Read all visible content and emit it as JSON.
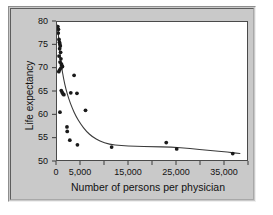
{
  "figure": {
    "background_color": "#ffffff",
    "panel_color": "#c9c9c9",
    "plot_background": "#ffffff",
    "frame_color": "#4a4a4a"
  },
  "chart_data": {
    "type": "scatter",
    "title": "",
    "xlabel": "Number of persons per physician",
    "ylabel": "Life expectancy",
    "xlim": [
      0,
      40000
    ],
    "ylim": [
      50,
      80
    ],
    "grid": false,
    "legend": null,
    "marker_color": "#1a1a1a",
    "curve_color": "#3a3a3a",
    "x_ticks": [
      0,
      5000,
      10000,
      15000,
      20000,
      25000,
      30000,
      35000,
      40000
    ],
    "x_tick_labels": [
      "0",
      "5,000",
      "",
      "15,000",
      "",
      "25,000",
      "",
      "35,000",
      ""
    ],
    "y_ticks": [
      50,
      55,
      60,
      65,
      70,
      75,
      80
    ],
    "y_tick_labels": [
      "50",
      "55",
      "60",
      "65",
      "70",
      "75",
      "80"
    ],
    "points": [
      [
        180,
        79.0
      ],
      [
        300,
        78.4
      ],
      [
        260,
        77.6
      ],
      [
        420,
        76.2
      ],
      [
        520,
        75.6
      ],
      [
        600,
        75.2
      ],
      [
        700,
        74.8
      ],
      [
        560,
        74.2
      ],
      [
        760,
        73.4
      ],
      [
        430,
        72.6
      ],
      [
        820,
        72.0
      ],
      [
        640,
        71.3
      ],
      [
        900,
        70.9
      ],
      [
        1000,
        70.6
      ],
      [
        1150,
        70.3
      ],
      [
        820,
        70.0
      ],
      [
        560,
        69.6
      ],
      [
        380,
        69.2
      ],
      [
        3600,
        68.4
      ],
      [
        900,
        65.1
      ],
      [
        1100,
        64.7
      ],
      [
        1250,
        64.4
      ],
      [
        1450,
        64.2
      ],
      [
        2900,
        64.6
      ],
      [
        4200,
        64.5
      ],
      [
        620,
        60.4
      ],
      [
        6000,
        60.8
      ],
      [
        2100,
        57.2
      ],
      [
        2150,
        56.2
      ],
      [
        2700,
        54.3
      ],
      [
        4300,
        53.3
      ],
      [
        11500,
        52.8
      ],
      [
        23000,
        53.8
      ],
      [
        25200,
        52.4
      ],
      [
        37000,
        51.4
      ]
    ],
    "fit_curve": [
      [
        150,
        79.3
      ],
      [
        400,
        75.6
      ],
      [
        700,
        72.4
      ],
      [
        1000,
        70.0
      ],
      [
        1400,
        67.6
      ],
      [
        1900,
        65.3
      ],
      [
        2500,
        63.2
      ],
      [
        3200,
        61.3
      ],
      [
        4000,
        59.5
      ],
      [
        5000,
        57.8
      ],
      [
        6200,
        56.2
      ],
      [
        7500,
        55.0
      ],
      [
        9000,
        54.1
      ],
      [
        11000,
        53.4
      ],
      [
        13500,
        53.1
      ],
      [
        16500,
        53.0
      ],
      [
        20000,
        52.9
      ],
      [
        24000,
        52.8
      ],
      [
        28000,
        52.5
      ],
      [
        32000,
        52.1
      ],
      [
        36000,
        51.7
      ],
      [
        38500,
        51.4
      ]
    ]
  }
}
